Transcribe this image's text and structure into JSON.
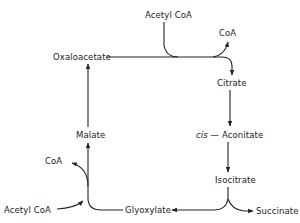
{
  "diagram": {
    "nodes": {
      "acetyl_coa_top": "Acetyl CoA",
      "coa_top": "CoA",
      "oxaloacetate": "Oxaloacetate",
      "citrate": "Citrate",
      "cis_prefix": "cis",
      "cis_aconitate": "— Aconitate",
      "isocitrate": "Isocitrate",
      "succinate": "Succinate",
      "glyoxylate": "Glyoxylate",
      "acetyl_coa_bottom": "Acetyl CoA",
      "coa_bottom": "CoA",
      "malate": "Malate"
    },
    "edges": [
      {
        "from": "Acetyl CoA",
        "to": "Oxaloacetate/Citrate junction"
      },
      {
        "from": "junction",
        "to": "CoA"
      },
      {
        "from": "Oxaloacetate",
        "to": "Citrate"
      },
      {
        "from": "Citrate",
        "to": "cis-Aconitate"
      },
      {
        "from": "cis-Aconitate",
        "to": "Isocitrate"
      },
      {
        "from": "Isocitrate",
        "to": "Glyoxylate"
      },
      {
        "from": "Isocitrate",
        "to": "Succinate"
      },
      {
        "from": "Glyoxylate",
        "to": "Malate"
      },
      {
        "from": "Acetyl CoA",
        "to": "Glyoxylate/Malate junction"
      },
      {
        "from": "junction",
        "to": "CoA"
      },
      {
        "from": "Malate",
        "to": "Oxaloacetate"
      }
    ],
    "line_color": "#222222"
  }
}
